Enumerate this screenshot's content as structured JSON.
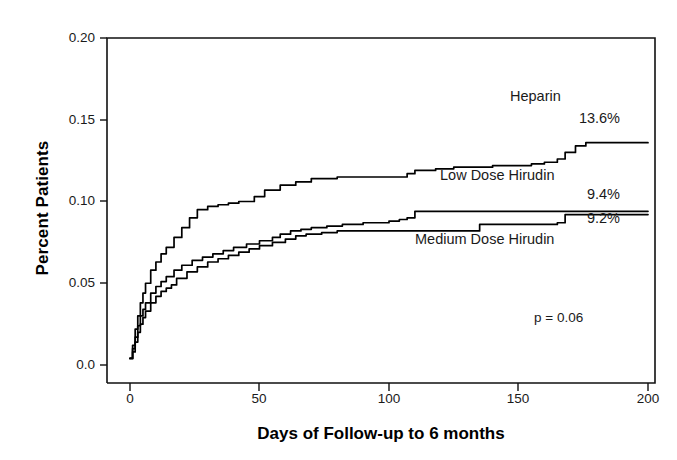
{
  "chart_data": {
    "type": "line",
    "title": "",
    "xlabel": "Days of Follow-up to 6 months",
    "ylabel": "Percent Patients",
    "xlim": [
      0,
      200
    ],
    "ylim": [
      0.0,
      0.2
    ],
    "xticks": [
      "0",
      "50",
      "100",
      "150",
      "200"
    ],
    "xtick_values": [
      0,
      50,
      100,
      150,
      200
    ],
    "yticks": [
      "0.0",
      "0.05",
      "0.10",
      "0.15",
      "0.20"
    ],
    "ytick_values": [
      0.0,
      0.05,
      0.1,
      0.15,
      0.2
    ],
    "grid": false,
    "legend_position": "inline-right",
    "annotations": [
      {
        "name": "p-value",
        "text": "p = 0.06",
        "x": 165,
        "y": 0.035
      }
    ],
    "series": [
      {
        "name": "Heparin",
        "end_label": "Heparin",
        "end_value_label": "13.6%",
        "end_value": 0.136,
        "color": "#000000",
        "x": [
          0,
          1,
          2,
          3,
          4,
          5,
          6,
          8,
          10,
          12,
          14,
          17,
          20,
          23,
          26,
          30,
          34,
          38,
          42,
          45,
          48,
          52,
          58,
          64,
          70,
          80,
          90,
          100,
          104,
          107,
          110,
          118,
          125,
          132,
          140,
          148,
          155,
          160,
          165,
          168,
          172,
          176,
          180,
          190,
          200
        ],
        "y": [
          0.004,
          0.012,
          0.022,
          0.03,
          0.038,
          0.044,
          0.05,
          0.058,
          0.063,
          0.068,
          0.072,
          0.078,
          0.084,
          0.09,
          0.095,
          0.097,
          0.098,
          0.099,
          0.1,
          0.1,
          0.103,
          0.107,
          0.11,
          0.112,
          0.114,
          0.115,
          0.115,
          0.115,
          0.115,
          0.117,
          0.119,
          0.12,
          0.121,
          0.121,
          0.122,
          0.122,
          0.123,
          0.124,
          0.126,
          0.13,
          0.134,
          0.136,
          0.136,
          0.136,
          0.136
        ]
      },
      {
        "name": "Low Dose Hirudin",
        "end_label": "Low Dose Hirudin",
        "end_value_label": "9.4%",
        "end_value": 0.094,
        "color": "#000000",
        "x": [
          0,
          1,
          2,
          3,
          4,
          5,
          6,
          8,
          10,
          12,
          14,
          17,
          20,
          24,
          28,
          32,
          36,
          40,
          45,
          50,
          55,
          58,
          62,
          66,
          70,
          76,
          82,
          90,
          100,
          104,
          107,
          110,
          115,
          125,
          135,
          145,
          155,
          165,
          172,
          180,
          190,
          200
        ],
        "y": [
          0.004,
          0.01,
          0.017,
          0.024,
          0.03,
          0.034,
          0.038,
          0.044,
          0.048,
          0.051,
          0.054,
          0.058,
          0.061,
          0.064,
          0.066,
          0.068,
          0.07,
          0.072,
          0.074,
          0.076,
          0.078,
          0.08,
          0.082,
          0.083,
          0.084,
          0.085,
          0.086,
          0.087,
          0.088,
          0.089,
          0.09,
          0.094,
          0.094,
          0.094,
          0.094,
          0.094,
          0.094,
          0.094,
          0.094,
          0.094,
          0.094,
          0.094
        ]
      },
      {
        "name": "Medium Dose Hirudin",
        "end_label": "Medium Dose Hirudin",
        "end_value_label": "9.2%",
        "end_value": 0.092,
        "color": "#000000",
        "x": [
          0,
          1,
          2,
          3,
          4,
          5,
          6,
          8,
          10,
          12,
          14,
          16,
          18,
          22,
          26,
          30,
          34,
          38,
          42,
          46,
          50,
          55,
          60,
          64,
          68,
          74,
          80,
          90,
          100,
          110,
          120,
          128,
          131,
          135,
          145,
          155,
          162,
          165,
          168,
          175,
          185,
          200
        ],
        "y": [
          0.004,
          0.008,
          0.014,
          0.02,
          0.025,
          0.029,
          0.033,
          0.038,
          0.042,
          0.045,
          0.047,
          0.049,
          0.053,
          0.057,
          0.06,
          0.063,
          0.065,
          0.067,
          0.069,
          0.071,
          0.073,
          0.075,
          0.077,
          0.079,
          0.08,
          0.081,
          0.082,
          0.082,
          0.082,
          0.082,
          0.082,
          0.082,
          0.082,
          0.086,
          0.086,
          0.086,
          0.086,
          0.087,
          0.092,
          0.092,
          0.092,
          0.092
        ]
      }
    ]
  },
  "axis": {
    "y_title": "Percent Patients",
    "x_title": "Days of Follow-up to 6 months"
  },
  "labels": {
    "heparin_name": "Heparin",
    "heparin_value": "13.6%",
    "low_dose_name": "Low Dose Hirudin",
    "low_dose_value": "9.4%",
    "medium_dose_value": "9.2%",
    "medium_dose_name": "Medium Dose Hirudin",
    "p_value": "p = 0.06"
  }
}
